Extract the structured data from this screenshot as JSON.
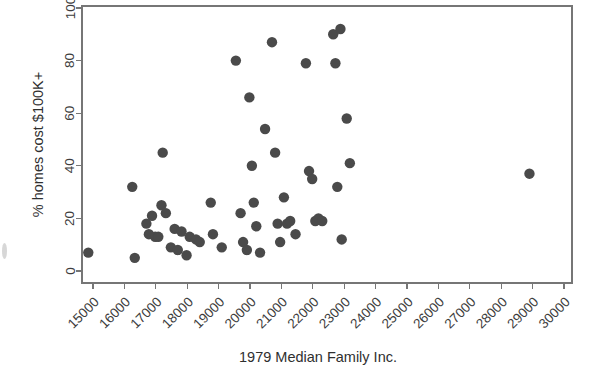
{
  "chart_data": {
    "type": "scatter",
    "title": "",
    "xlabel": "1979 Median Family Inc.",
    "ylabel": "% homes cost $100K+",
    "xlim": [
      15000,
      30000
    ],
    "ylim": [
      0,
      100
    ],
    "xticks": [
      15000,
      16000,
      17000,
      18000,
      19000,
      20000,
      21000,
      22000,
      23000,
      24000,
      25000,
      26000,
      27000,
      28000,
      29000,
      30000
    ],
    "xtick_labels": [
      "15000",
      "16000",
      "17000",
      "18000",
      "19000",
      "20000",
      "21000",
      "22000",
      "23000",
      "24000",
      "25000",
      "26000",
      "27000",
      "28000",
      "29000",
      "30000"
    ],
    "yticks": [
      0,
      20,
      40,
      60,
      80,
      100
    ],
    "ytick_labels": [
      "0",
      "20",
      "40",
      "60",
      "80",
      "100"
    ],
    "grid": false,
    "legend": false,
    "marker_color": "#4a4a4a",
    "marker_size": 5.2,
    "points": [
      {
        "x": 14850,
        "y": 7
      },
      {
        "x": 16250,
        "y": 32
      },
      {
        "x": 16330,
        "y": 5
      },
      {
        "x": 16700,
        "y": 18
      },
      {
        "x": 16780,
        "y": 14
      },
      {
        "x": 16880,
        "y": 21
      },
      {
        "x": 16980,
        "y": 13
      },
      {
        "x": 17080,
        "y": 13
      },
      {
        "x": 17180,
        "y": 25
      },
      {
        "x": 17220,
        "y": 45
      },
      {
        "x": 17320,
        "y": 22
      },
      {
        "x": 17480,
        "y": 9
      },
      {
        "x": 17600,
        "y": 16
      },
      {
        "x": 17700,
        "y": 8
      },
      {
        "x": 17820,
        "y": 15
      },
      {
        "x": 17980,
        "y": 6
      },
      {
        "x": 18080,
        "y": 13
      },
      {
        "x": 18280,
        "y": 12
      },
      {
        "x": 18400,
        "y": 11
      },
      {
        "x": 18750,
        "y": 26
      },
      {
        "x": 18820,
        "y": 14
      },
      {
        "x": 19100,
        "y": 9
      },
      {
        "x": 19550,
        "y": 80
      },
      {
        "x": 19700,
        "y": 22
      },
      {
        "x": 19780,
        "y": 11
      },
      {
        "x": 19900,
        "y": 8
      },
      {
        "x": 19980,
        "y": 66
      },
      {
        "x": 20060,
        "y": 40
      },
      {
        "x": 20120,
        "y": 26
      },
      {
        "x": 20200,
        "y": 17
      },
      {
        "x": 20320,
        "y": 7
      },
      {
        "x": 20480,
        "y": 54
      },
      {
        "x": 20700,
        "y": 87
      },
      {
        "x": 20800,
        "y": 45
      },
      {
        "x": 20880,
        "y": 18
      },
      {
        "x": 20960,
        "y": 11
      },
      {
        "x": 21080,
        "y": 28
      },
      {
        "x": 21180,
        "y": 18
      },
      {
        "x": 21280,
        "y": 19
      },
      {
        "x": 21450,
        "y": 14
      },
      {
        "x": 21780,
        "y": 79
      },
      {
        "x": 21880,
        "y": 38
      },
      {
        "x": 21980,
        "y": 35
      },
      {
        "x": 22080,
        "y": 19
      },
      {
        "x": 22180,
        "y": 20
      },
      {
        "x": 22300,
        "y": 19
      },
      {
        "x": 22650,
        "y": 90
      },
      {
        "x": 22720,
        "y": 79
      },
      {
        "x": 22780,
        "y": 32
      },
      {
        "x": 22880,
        "y": 92
      },
      {
        "x": 22920,
        "y": 12
      },
      {
        "x": 23080,
        "y": 58
      },
      {
        "x": 23180,
        "y": 41
      },
      {
        "x": 28900,
        "y": 37
      }
    ]
  },
  "layout": {
    "plot_left": 82,
    "plot_right": 572,
    "plot_top": 6,
    "plot_bottom": 283
  }
}
